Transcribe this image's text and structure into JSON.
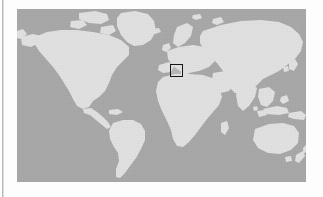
{
  "figure": {
    "kind": "world-locator-map",
    "projection": "equirectangular",
    "title": "",
    "caption": "",
    "ocean_color": "#a9a9a9",
    "land_color": "#e2e2e2",
    "page_background": "#fdfdfd",
    "margin_rule_color": "#b9b9b9",
    "map_bounds_px": {
      "x": 17,
      "y": 9,
      "width": 289,
      "height": 173
    },
    "coverage": {
      "longitude_range": "-180 to 180",
      "latitude_range": "approx 83N to 57S (Antarctica cropped)"
    }
  },
  "locator_box": {
    "label": "",
    "region_indicated": "Central Europe",
    "stroke_color": "#181818",
    "stroke_width_px": 1.5,
    "bounds_px": {
      "x": 170,
      "y": 64,
      "width": 14,
      "height": 14
    }
  },
  "landmasses": [
    {
      "name": "North America"
    },
    {
      "name": "Greenland"
    },
    {
      "name": "South America"
    },
    {
      "name": "Europe"
    },
    {
      "name": "Africa"
    },
    {
      "name": "Asia"
    },
    {
      "name": "Australia"
    },
    {
      "name": "New Zealand"
    },
    {
      "name": "Indonesia"
    },
    {
      "name": "Japan"
    },
    {
      "name": "Madagascar"
    },
    {
      "name": "British Isles"
    },
    {
      "name": "Iceland"
    },
    {
      "name": "Scandinavia"
    }
  ]
}
